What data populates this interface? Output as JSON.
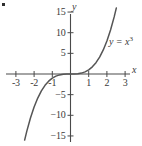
{
  "figure": {
    "background_color": "#ffffff",
    "axis_color": "#4a4a4a",
    "curve_color": "#555555",
    "text_color": "#3a3a3a",
    "width": 142,
    "height": 146
  },
  "corner_mark": {
    "label": "",
    "name": "corner-bullet"
  },
  "chart_data": {
    "type": "line",
    "title": "",
    "subtitle": "",
    "xlabel": "x",
    "ylabel": "y",
    "xlim": [
      -3.3,
      3.3
    ],
    "ylim": [
      -16.5,
      16.5
    ],
    "grid": false,
    "legend_position": "none",
    "annotations": [
      {
        "text": "y = x",
        "exponent": "3",
        "x": 2.0,
        "y": 7.5,
        "name": "curve-equation-label"
      }
    ],
    "xticks": [
      -3,
      -2,
      -1,
      1,
      2,
      3
    ],
    "xtick_labels": [
      "-3",
      "-2",
      "-1",
      "1",
      "2",
      "3"
    ],
    "yticks": [
      15,
      10,
      5,
      -5,
      -10,
      -15
    ],
    "ytick_labels": [
      "15",
      "10",
      "5",
      "-5",
      "-10",
      "-15"
    ],
    "series": [
      {
        "name": "y = x^3",
        "equation": "y = x^3",
        "x": [
          -2.52,
          -2.4,
          -2.2,
          -2.0,
          -1.8,
          -1.6,
          -1.4,
          -1.2,
          -1.0,
          -0.8,
          -0.6,
          -0.4,
          -0.2,
          0.0,
          0.2,
          0.4,
          0.6,
          0.8,
          1.0,
          1.2,
          1.4,
          1.6,
          1.8,
          2.0,
          2.2,
          2.4,
          2.52
        ],
        "y": [
          -16.0,
          -13.82,
          -10.65,
          -8.0,
          -5.83,
          -4.1,
          -2.74,
          -1.73,
          -1.0,
          -0.51,
          -0.22,
          -0.06,
          -0.01,
          0.0,
          0.01,
          0.06,
          0.22,
          0.51,
          1.0,
          1.73,
          2.74,
          4.1,
          5.83,
          8.0,
          10.65,
          13.82,
          16.0
        ]
      }
    ]
  }
}
